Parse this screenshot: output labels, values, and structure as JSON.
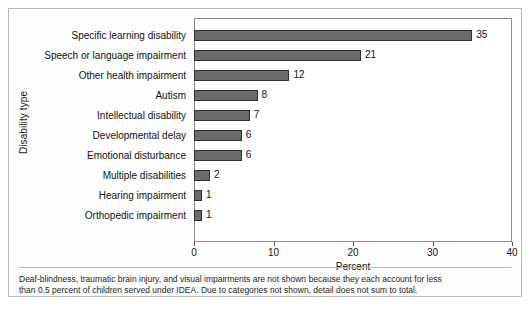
{
  "chart_data": {
    "type": "bar",
    "orientation": "horizontal",
    "title": "",
    "xlabel": "Percent",
    "ylabel": "Disability type",
    "xlim": [
      0,
      40
    ],
    "xticks": [
      0,
      10,
      20,
      30,
      40
    ],
    "xtick_labels": [
      "0",
      "10",
      "20",
      "30",
      "40"
    ],
    "grid": false,
    "legend": null,
    "categories": [
      "Specific learning disability",
      "Speech or language impairment",
      "Other health impairment",
      "Autism",
      "Intellectual disability",
      "Developmental delay",
      "Emotional disturbance",
      "Multiple disabilities",
      "Hearing impairment",
      "Orthopedic impairment"
    ],
    "values": [
      35,
      21,
      12,
      8,
      7,
      6,
      6,
      2,
      1,
      1
    ],
    "value_labels": [
      "35",
      "21",
      "12",
      "8",
      "7",
      "6",
      "6",
      "2",
      "1",
      "1"
    ],
    "bar_color": "#6b6b6b",
    "bar_edge_color": "#2e2e2e",
    "annotations": [
      "Deaf-blindness, traumatic brain injury, and visual impairments are not shown because they each account for less",
      "than 0.5 percent of children served under IDEA. Due to categories not shown, detail does not sum to total."
    ]
  },
  "figure": {
    "background": "#fdfdfd",
    "border_color": "#b9b9b9"
  }
}
